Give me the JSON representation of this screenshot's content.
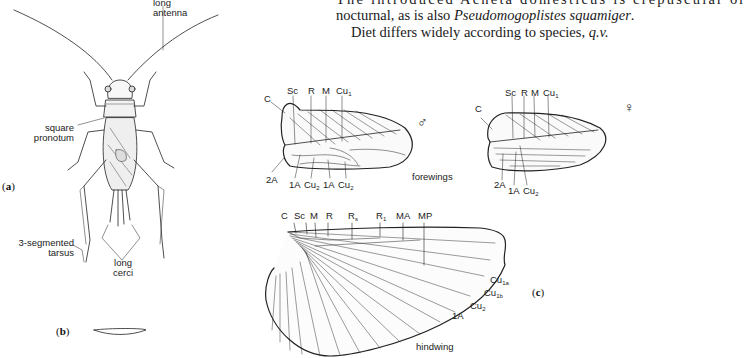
{
  "prose": {
    "line0": "The introduced Acheta domesticus is crepuscular or",
    "line1_pre": "nocturnal, as is also ",
    "line1_italic": "Pseudomogoplistes squamiger",
    "line1_post": ".",
    "line2_pre": "Diet differs widely according to species, ",
    "line2_italic": "q.v."
  },
  "panels": {
    "a": "a",
    "b": "b",
    "c": "c"
  },
  "insect_labels": {
    "antenna_1": "long",
    "antenna_2": "antenna",
    "pronotum_1": "square",
    "pronotum_2": "pronotum",
    "tarsus_1": "3-segmented",
    "tarsus_2": "tarsus",
    "cerci_1": "long",
    "cerci_2": "cerci"
  },
  "forewing_male": {
    "sex_symbol": "♂",
    "top_veins": [
      "C",
      "Sc",
      "R",
      "M",
      "Cu"
    ],
    "cu_sub": "1",
    "bottom_veins": [
      "2A",
      "1A",
      "Cu",
      "1A",
      "Cu"
    ],
    "cu2_sub": "2"
  },
  "forewing_female": {
    "sex_symbol": "♀",
    "top_veins": [
      "C",
      "Sc",
      "R",
      "M",
      "Cu"
    ],
    "cu_sub": "1",
    "bottom_veins": [
      "2A",
      "1A",
      "Cu"
    ],
    "cu2_sub": "2"
  },
  "forewings_caption": "forewings",
  "hindwing": {
    "top_veins": [
      "C",
      "Sc",
      "M",
      "R",
      "R",
      "R",
      "MA",
      "MP"
    ],
    "rs_sub": "s",
    "r1_sub": "1",
    "edge_veins": [
      {
        "base": "Cu",
        "sub": "1a"
      },
      {
        "base": "Cu",
        "sub": "1b"
      },
      {
        "base": "Cu",
        "sub": "2"
      },
      {
        "base": "1A",
        "sub": ""
      }
    ],
    "caption": "hindwing"
  }
}
